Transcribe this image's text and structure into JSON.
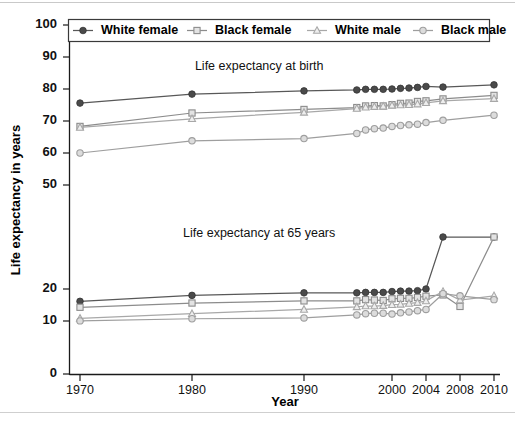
{
  "chart_data": {
    "type": "line",
    "title": "",
    "xlabel": "Year",
    "ylabel": "Life expectancy in years",
    "grid": false,
    "legend_position": "top",
    "axis_break": true,
    "ylim": [
      0,
      100
    ],
    "ytick_labels": [
      "100",
      "90",
      "80",
      "70",
      "60",
      "50",
      "20",
      "10",
      "0"
    ],
    "ytick_values": [
      100,
      90,
      80,
      70,
      60,
      50,
      20,
      10,
      0
    ],
    "xtick_labels": [
      "1970",
      "1980",
      "1990",
      "2000",
      "2004",
      "2008",
      "2010"
    ],
    "xtick_values": [
      1970,
      1980,
      1990,
      2000,
      2004,
      2008,
      2010
    ],
    "annotations": [
      {
        "text": "Life expectancy at birth",
        "x": 1986,
        "y": 86
      },
      {
        "text": "Life expectancy at 65 years",
        "x": 1986,
        "y": 24.6
      }
    ],
    "series": [
      {
        "name": "White female",
        "marker": "filled-circle",
        "color": "#585858",
        "groups": [
          {
            "group": "at birth",
            "x": [
              1970,
              1980,
              1990,
              1996,
              1997,
              1998,
              1999,
              2000,
              2001,
              2002,
              2003,
              2004,
              2006,
              2010
            ],
            "y": [
              75.6,
              78.4,
              79.4,
              79.7,
              79.9,
              79.9,
              79.9,
              80.0,
              80.2,
              80.3,
              80.5,
              80.8,
              80.6,
              81.3
            ]
          },
          {
            "group": "at 65 years",
            "x": [
              1970,
              1980,
              1990,
              1996,
              1997,
              1998,
              1999,
              2000,
              2001,
              2002,
              2003,
              2004,
              2006,
              2010
            ],
            "y": [
              17.1,
              18.5,
              19.1,
              19.1,
              19.2,
              19.2,
              19.2,
              19.4,
              19.5,
              19.5,
              19.6,
              20.0,
              20.3,
              20.7
            ]
          }
        ]
      },
      {
        "name": "Black female",
        "marker": "open-square",
        "color": "#8c8c8c",
        "groups": [
          {
            "group": "at birth",
            "x": [
              1970,
              1980,
              1990,
              1996,
              1997,
              1998,
              1999,
              2000,
              2001,
              2002,
              2003,
              2004,
              2006,
              2010
            ],
            "y": [
              68.3,
              72.5,
              73.6,
              74.2,
              74.7,
              74.8,
              74.7,
              75.1,
              75.5,
              75.6,
              76.1,
              76.3,
              76.9,
              78.0
            ]
          },
          {
            "group": "at 65 years",
            "x": [
              1970,
              1980,
              1990,
              1996,
              1997,
              1998,
              1999,
              2000,
              2001,
              2002,
              2003,
              2004,
              2006,
              2008,
              2010
            ],
            "y": [
              15.7,
              16.7,
              17.2,
              17.2,
              17.5,
              17.4,
              17.3,
              17.7,
              17.8,
              17.8,
              18.0,
              18.3,
              18.6,
              15.9,
              21.3
            ]
          }
        ]
      },
      {
        "name": "White male",
        "marker": "open-triangle",
        "color": "#a8a8a8",
        "groups": [
          {
            "group": "at birth",
            "x": [
              1970,
              1980,
              1990,
              1996,
              1997,
              1998,
              1999,
              2000,
              2001,
              2002,
              2003,
              2004,
              2006,
              2010
            ],
            "y": [
              68.0,
              70.7,
              72.7,
              73.9,
              74.3,
              74.5,
              74.6,
              74.9,
              75.0,
              75.1,
              75.3,
              75.7,
              76.3,
              77.0
            ]
          },
          {
            "group": "at 65 years",
            "x": [
              1970,
              1980,
              1990,
              1996,
              1997,
              1998,
              1999,
              2000,
              2001,
              2002,
              2003,
              2004,
              2006,
              2008,
              2010
            ],
            "y": [
              13.1,
              14.2,
              15.2,
              15.8,
              16.0,
              16.0,
              16.1,
              16.3,
              16.4,
              16.6,
              16.8,
              17.2,
              19.4,
              17.4,
              18.4
            ]
          }
        ]
      },
      {
        "name": "Black male",
        "marker": "open-circle",
        "color": "#9e9e9e",
        "groups": [
          {
            "group": "at birth",
            "x": [
              1970,
              1980,
              1990,
              1996,
              1997,
              1998,
              1999,
              2000,
              2001,
              2002,
              2003,
              2004,
              2006,
              2010
            ],
            "y": [
              60.0,
              63.8,
              64.5,
              66.1,
              67.2,
              67.6,
              67.8,
              68.3,
              68.6,
              68.8,
              69.0,
              69.5,
              70.2,
              71.8
            ]
          },
          {
            "group": "at 65 years",
            "x": [
              1970,
              1980,
              1990,
              1996,
              1997,
              1998,
              1999,
              2000,
              2001,
              2002,
              2003,
              2004,
              2006,
              2008,
              2010
            ],
            "y": [
              12.5,
              13.0,
              13.2,
              13.9,
              14.2,
              14.3,
              14.3,
              14.1,
              14.4,
              14.6,
              14.9,
              15.2,
              18.9,
              18.4,
              17.5
            ]
          }
        ]
      }
    ]
  },
  "legend": {
    "entries": [
      {
        "label": "White female"
      },
      {
        "label": "Black female"
      },
      {
        "label": "White male"
      },
      {
        "label": "Black male"
      }
    ]
  }
}
